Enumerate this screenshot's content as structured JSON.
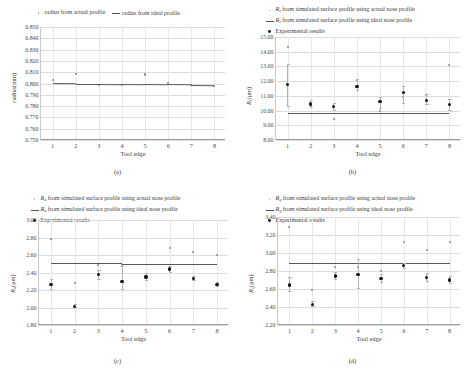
{
  "figure": {
    "panels": [
      {
        "caption": "(a)",
        "legend": [
          {
            "marker": "dot-small",
            "text": "radius from actual profile"
          },
          {
            "marker": "line",
            "text": "radius from ideal profile"
          }
        ],
        "chart_data": {
          "type": "scatter",
          "title": "",
          "xlabel": "Tool edge",
          "ylabel": "radius (mm)",
          "ylabel_symbol": "radius",
          "ylabel_units": "(mm)",
          "categories": [
            1,
            2,
            3,
            4,
            5,
            6,
            7,
            8
          ],
          "xlim": [
            0.5,
            8.5
          ],
          "ylim": [
            0.75,
            0.85
          ],
          "yticks": [
            "0.850",
            "0.840",
            "0.830",
            "0.820",
            "0.810",
            "0.800",
            "0.790",
            "0.780",
            "0.770",
            "0.760",
            "0.750"
          ],
          "ytick_values": [
            0.85,
            0.84,
            0.83,
            0.82,
            0.81,
            0.8,
            0.79,
            0.78,
            0.77,
            0.76,
            0.75
          ],
          "grid": true,
          "legend_position": "top",
          "series": [
            {
              "name": "radius from actual profile",
              "style": "scatter-light",
              "values": [
                0.803,
                0.8085,
                0.7985,
                0.7985,
                0.808,
                0.8005,
                0.7985,
                0.798
              ]
            },
            {
              "name": "radius from ideal profile",
              "style": "line",
              "values": [
                0.8002,
                0.8,
                0.7999,
                0.7997,
                0.7995,
                0.7993,
                0.7991,
                0.7989
              ]
            }
          ]
        }
      },
      {
        "caption": "(b)",
        "legend": [
          {
            "marker": "dot-small",
            "symbol": "R",
            "subscript": "z",
            "text": " from simulated surface profile using actual nose profile"
          },
          {
            "marker": "line",
            "symbol": "R",
            "subscript": "z",
            "text": " from simulated surface profile using ideal nose profile"
          },
          {
            "marker": "dot-big",
            "text": "Experimental results"
          }
        ],
        "chart_data": {
          "type": "scatter",
          "title": "",
          "xlabel": "Tool edge",
          "ylabel_symbol": "R",
          "ylabel_subscript": "z",
          "ylabel_units": "(μm)",
          "categories": [
            1,
            2,
            3,
            4,
            5,
            6,
            7,
            8
          ],
          "xlim": [
            0.5,
            8.5
          ],
          "ylim": [
            8.0,
            15.0
          ],
          "yticks": [
            "15.00",
            "14.00",
            "13.00",
            "12.00",
            "11.00",
            "10.00",
            "9.00",
            "8.00"
          ],
          "ytick_values": [
            15.0,
            14.0,
            13.0,
            12.0,
            11.0,
            10.0,
            9.0,
            8.0
          ],
          "grid": true,
          "legend_position": "top",
          "series": [
            {
              "name": "Rz from simulated surface profile using actual nose profile",
              "style": "scatter-light",
              "values": [
                14.35,
                10.3,
                9.4,
                12.05,
                9.95,
                10.95,
                11.05,
                13.1
              ]
            },
            {
              "name": "Rz from simulated surface profile using ideal nose profile",
              "style": "line",
              "values": [
                9.85,
                9.85,
                9.85,
                9.85,
                9.85,
                9.85,
                9.85,
                9.85
              ]
            },
            {
              "name": "Experimental results",
              "style": "scatter-bold",
              "values": [
                11.75,
                10.45,
                10.3,
                11.65,
                10.6,
                11.25,
                10.7,
                10.4
              ],
              "err_low": [
                10.25,
                10.15,
                10.0,
                11.35,
                10.1,
                10.45,
                10.4,
                10.0
              ],
              "err_high": [
                13.15,
                10.75,
                10.5,
                12.15,
                10.9,
                11.65,
                11.1,
                10.8
              ]
            }
          ]
        }
      },
      {
        "caption": "(c)",
        "legend": [
          {
            "marker": "dot-small",
            "symbol": "R",
            "subscript": "a",
            "text": " from simulated surface profile using actual nose profile"
          },
          {
            "marker": "line",
            "symbol": "R",
            "subscript": "a",
            "text": " from simulated surface profile using ideal nose profile"
          },
          {
            "marker": "dot-big",
            "text": "Experimental results"
          }
        ],
        "chart_data": {
          "type": "scatter",
          "title": "",
          "xlabel": "Tool edge",
          "ylabel_symbol": "R",
          "ylabel_subscript": "a",
          "ylabel_units": "(μm)",
          "categories": [
            1,
            2,
            3,
            4,
            5,
            6,
            7,
            8
          ],
          "xlim": [
            0.5,
            8.5
          ],
          "ylim": [
            1.8,
            3.0
          ],
          "yticks": [
            "3.00",
            "2.80",
            "2.60",
            "2.40",
            "2.20",
            "2.00",
            "1.80"
          ],
          "ytick_values": [
            3.0,
            2.8,
            2.6,
            2.4,
            2.2,
            2.0,
            1.8
          ],
          "grid": true,
          "legend_position": "top",
          "series": [
            {
              "name": "Ra from simulated surface profile using actual nose profile",
              "style": "scatter-light",
              "values": [
                2.785,
                2.285,
                2.49,
                2.49,
                2.35,
                2.675,
                2.635,
                2.6
              ]
            },
            {
              "name": "Ra from simulated surface profile using ideal nose profile",
              "style": "line",
              "values": [
                2.505,
                2.504,
                2.503,
                2.502,
                2.501,
                2.5,
                2.499,
                2.498
              ]
            },
            {
              "name": "Experimental results",
              "style": "scatter-bold",
              "values": [
                2.265,
                2.015,
                2.375,
                2.3,
                2.35,
                2.44,
                2.33,
                2.265
              ],
              "err_low": [
                2.2,
                1.99,
                2.32,
                2.2,
                2.3,
                2.4,
                2.3,
                2.24
              ],
              "err_high": [
                2.33,
                2.04,
                2.43,
                2.48,
                2.4,
                2.48,
                2.36,
                2.29
              ]
            }
          ]
        }
      },
      {
        "caption": "(d)",
        "legend": [
          {
            "marker": "dot-small",
            "symbol": "R",
            "subscript": "q",
            "text": " from simulated surface profile using actual nose profile"
          },
          {
            "marker": "line",
            "symbol": "R",
            "subscript": "q",
            "text": " from simulated surface profile using ideal nose profile"
          },
          {
            "marker": "dot-big",
            "text": "Experimental results"
          }
        ],
        "chart_data": {
          "type": "scatter",
          "title": "",
          "xlabel": "Tool edge",
          "ylabel_symbol": "R",
          "ylabel_subscript": "q",
          "ylabel_units": "(μm)",
          "categories": [
            1,
            2,
            3,
            4,
            5,
            6,
            7,
            8
          ],
          "xlim": [
            0.5,
            8.5
          ],
          "ylim": [
            2.2,
            3.4
          ],
          "yticks": [
            "3.40",
            "3.20",
            "3.00",
            "2.80",
            "2.60",
            "2.40",
            "2.20"
          ],
          "ytick_values": [
            3.4,
            3.2,
            3.0,
            2.8,
            2.6,
            2.4,
            2.2
          ],
          "grid": true,
          "legend_position": "top",
          "series": [
            {
              "name": "Rq from simulated surface profile using actual nose profile",
              "style": "scatter-light",
              "values": [
                3.29,
                2.59,
                2.845,
                2.84,
                2.795,
                3.125,
                3.03,
                3.125
              ]
            },
            {
              "name": "Rq from simulated surface profile using ideal nose profile",
              "style": "line",
              "values": [
                2.89,
                2.89,
                2.89,
                2.89,
                2.891,
                2.891,
                2.891,
                2.892
              ]
            },
            {
              "name": "Experimental results",
              "style": "scatter-bold",
              "values": [
                2.645,
                2.43,
                2.745,
                2.765,
                2.715,
                2.86,
                2.725,
                2.7
              ],
              "err_low": [
                2.565,
                2.4,
                2.705,
                2.605,
                2.665,
                2.825,
                2.68,
                2.655
              ],
              "err_high": [
                2.73,
                2.465,
                2.79,
                2.93,
                2.765,
                2.89,
                2.775,
                2.74
              ]
            }
          ]
        }
      }
    ]
  }
}
